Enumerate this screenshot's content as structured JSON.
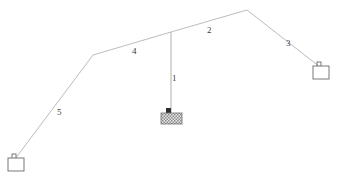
{
  "diagram": {
    "stroke_color": "#b9b9b9",
    "label_color": "#3b3b3b",
    "background": "#ffffff",
    "members": [
      {
        "id": "1",
        "label": "1",
        "label_x": 172,
        "label_y": 74,
        "x1": 171,
        "y1": 32,
        "x2": 171,
        "y2": 112
      },
      {
        "id": "2",
        "label": "2",
        "label_x": 207,
        "label_y": 26,
        "x1": 171,
        "y1": 32,
        "x2": 247,
        "y2": 10
      },
      {
        "id": "3",
        "label": "3",
        "label_x": 286,
        "label_y": 39,
        "x1": 247,
        "y1": 10,
        "x2": 320,
        "y2": 67
      },
      {
        "id": "4",
        "label": "4",
        "label_x": 132,
        "label_y": 47,
        "x1": 93,
        "y1": 55,
        "x2": 171,
        "y2": 32
      },
      {
        "id": "5",
        "label": "5",
        "label_x": 57,
        "label_y": 108,
        "x1": 93,
        "y1": 55,
        "x2": 15,
        "y2": 159
      }
    ],
    "supports": [
      {
        "id": "support-right",
        "x": 313,
        "y": 66,
        "w": 16,
        "h": 13
      },
      {
        "id": "support-left",
        "x": 8,
        "y": 158,
        "w": 16,
        "h": 13
      }
    ],
    "load_block": {
      "id": "load-block",
      "x": 161,
      "y": 112,
      "w": 21,
      "h": 11
    }
  }
}
